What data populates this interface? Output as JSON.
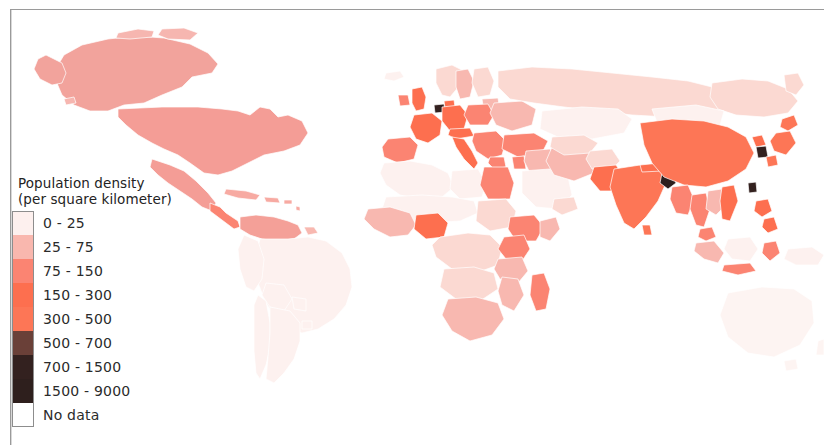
{
  "page": {
    "background_color": "#ffffff",
    "border_color": "#9a9a9a"
  },
  "legend": {
    "title_line1": "Population density",
    "title_line2": "(per square kilometer)",
    "items": [
      {
        "label": "0 - 25",
        "color": "#fdf0ee"
      },
      {
        "label": "25 - 75",
        "color": "#f9b7ae"
      },
      {
        "label": "75 - 150",
        "color": "#fb8472"
      },
      {
        "label": "150 - 300",
        "color": "#fd6f4f"
      },
      {
        "label": "300 - 500",
        "color": "#fd7656"
      },
      {
        "label": "500 - 700",
        "color": "#6a4038"
      },
      {
        "label": "700 - 1500",
        "color": "#33211f"
      },
      {
        "label": "1500 - 9000",
        "color": "#2e1f1d"
      },
      {
        "label": "No data",
        "color": "#ffffff"
      }
    ]
  },
  "chart_data": {
    "type": "map",
    "title": "Population density (per square kilometer)",
    "projection": "world-equirectangular-cropped",
    "legend_position": "lower-left",
    "grid": false,
    "no_data_color": "#ffffff",
    "bins": [
      {
        "range": "0 - 25",
        "min": 0,
        "max": 25,
        "color": "#fdf0ee"
      },
      {
        "range": "25 - 75",
        "min": 25,
        "max": 75,
        "color": "#f9b7ae"
      },
      {
        "range": "75 - 150",
        "min": 75,
        "max": 150,
        "color": "#fb8472"
      },
      {
        "range": "150 - 300",
        "min": 150,
        "max": 300,
        "color": "#fd6f4f"
      },
      {
        "range": "300 - 500",
        "min": 300,
        "max": 500,
        "color": "#fd7656"
      },
      {
        "range": "500 - 700",
        "min": 500,
        "max": 700,
        "color": "#6a4038"
      },
      {
        "range": "700 - 1500",
        "min": 700,
        "max": 1500,
        "color": "#33211f"
      },
      {
        "range": "1500 - 9000",
        "min": 1500,
        "max": 9000,
        "color": "#2e1f1d"
      }
    ],
    "regions": [
      {
        "name": "Canada",
        "bin": "25 - 75"
      },
      {
        "name": "Alaska",
        "bin": "25 - 75"
      },
      {
        "name": "United States",
        "bin": "25 - 75"
      },
      {
        "name": "Mexico",
        "bin": "25 - 75"
      },
      {
        "name": "Central America",
        "bin": "75 - 150"
      },
      {
        "name": "Caribbean",
        "bin": "25 - 75"
      },
      {
        "name": "Colombia / Venezuela",
        "bin": "25 - 75"
      },
      {
        "name": "Brazil",
        "bin": "0 - 25"
      },
      {
        "name": "Argentina",
        "bin": "0 - 25"
      },
      {
        "name": "Chile",
        "bin": "0 - 25"
      },
      {
        "name": "Western Europe",
        "bin": "150 - 300"
      },
      {
        "name": "United Kingdom",
        "bin": "150 - 300"
      },
      {
        "name": "Netherlands",
        "bin": "700 - 1500"
      },
      {
        "name": "Germany",
        "bin": "150 - 300"
      },
      {
        "name": "Italy",
        "bin": "150 - 300"
      },
      {
        "name": "Eastern Europe",
        "bin": "75 - 150"
      },
      {
        "name": "Russia",
        "bin": "25 - 75"
      },
      {
        "name": "Turkey",
        "bin": "75 - 150"
      },
      {
        "name": "Egypt",
        "bin": "75 - 150"
      },
      {
        "name": "North Africa",
        "bin": "0 - 25"
      },
      {
        "name": "Nigeria",
        "bin": "150 - 300"
      },
      {
        "name": "West Africa",
        "bin": "75 - 150"
      },
      {
        "name": "Central Africa",
        "bin": "25 - 75"
      },
      {
        "name": "Ethiopia",
        "bin": "75 - 150"
      },
      {
        "name": "Kenya",
        "bin": "75 - 150"
      },
      {
        "name": "South Africa",
        "bin": "25 - 75"
      },
      {
        "name": "Madagascar",
        "bin": "75 - 150"
      },
      {
        "name": "Saudi Arabia",
        "bin": "0 - 25"
      },
      {
        "name": "Iran",
        "bin": "25 - 75"
      },
      {
        "name": "Kazakhstan",
        "bin": "0 - 25"
      },
      {
        "name": "India",
        "bin": "300 - 500"
      },
      {
        "name": "Pakistan",
        "bin": "150 - 300"
      },
      {
        "name": "Bangladesh",
        "bin": "700 - 1500"
      },
      {
        "name": "Sri Lanka",
        "bin": "300 - 500"
      },
      {
        "name": "China",
        "bin": "150 - 300"
      },
      {
        "name": "Mongolia",
        "bin": "0 - 25"
      },
      {
        "name": "Japan",
        "bin": "300 - 500"
      },
      {
        "name": "South Korea",
        "bin": "500 - 700"
      },
      {
        "name": "Taiwan",
        "bin": "500 - 700"
      },
      {
        "name": "Vietnam",
        "bin": "150 - 300"
      },
      {
        "name": "Thailand",
        "bin": "75 - 150"
      },
      {
        "name": "Myanmar",
        "bin": "75 - 150"
      },
      {
        "name": "Philippines",
        "bin": "150 - 300"
      },
      {
        "name": "Indonesia",
        "bin": "75 - 150"
      },
      {
        "name": "Malaysia",
        "bin": "75 - 150"
      },
      {
        "name": "Australia",
        "bin": "0 - 25"
      },
      {
        "name": "New Zealand",
        "bin": "0 - 25"
      },
      {
        "name": "Greenland",
        "bin": "No data"
      }
    ]
  }
}
